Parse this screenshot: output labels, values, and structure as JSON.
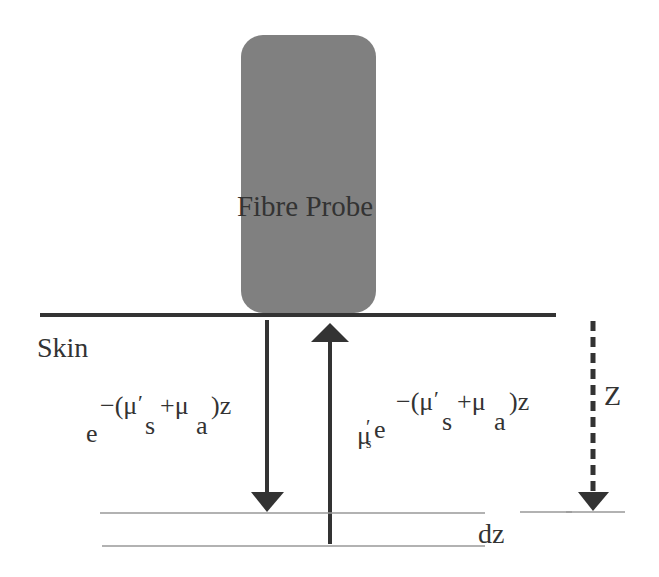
{
  "diagram": {
    "probe": {
      "label": "Fibre Probe",
      "fill": "#808080"
    },
    "skin_label": "Skin",
    "incident": {
      "base": "e",
      "exponent_prefix": "−(μ",
      "prime": "′",
      "sub_s": "s",
      "plus_mu": "+μ",
      "sub_a": "a",
      "exponent_suffix": ")z"
    },
    "returning": {
      "coef": "μ",
      "coef_prime": "′",
      "coef_sub": "s",
      "base": "e",
      "exponent_prefix": "−(μ",
      "prime": "′",
      "sub_s": "s",
      "plus_mu": "+μ",
      "sub_a": "a",
      "exponent_suffix": ")z"
    },
    "depth_label": "Z",
    "slice_label": "dz",
    "colors": {
      "line": "#333333",
      "thin_line": "#999999",
      "text": "#333333"
    }
  }
}
